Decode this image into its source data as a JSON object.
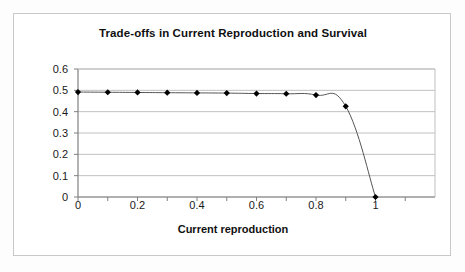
{
  "chart_data": {
    "type": "line",
    "title": "Trade-offs in Current Reproduction and Survival",
    "xlabel": "Current reproduction",
    "ylabel": "Adjusted survival",
    "xlim": [
      0,
      1.2
    ],
    "ylim": [
      0,
      0.6
    ],
    "grid": "horizontal",
    "legend": "none",
    "marker": "diamond",
    "x": [
      0,
      0.1,
      0.2,
      0.3,
      0.4,
      0.5,
      0.6,
      0.7,
      0.8,
      0.9,
      1
    ],
    "values": [
      0.492,
      0.491,
      0.49,
      0.489,
      0.488,
      0.487,
      0.485,
      0.484,
      0.478,
      0.425,
      0
    ],
    "xticks": [
      0,
      0.2,
      0.4,
      0.6,
      0.8,
      1
    ],
    "xtick_labels": [
      "0",
      "0.2",
      "0.4",
      "0.6",
      "0.8",
      "1"
    ],
    "xticks_minor": [
      0.1,
      0.3,
      0.5,
      0.7,
      0.9,
      1.1
    ],
    "yticks": [
      0,
      0.1,
      0.2,
      0.3,
      0.4,
      0.5,
      0.6
    ],
    "ytick_labels": [
      "0",
      "0.1",
      "0.2",
      "0.3",
      "0.4",
      "0.5",
      "0.6"
    ],
    "series": [
      {
        "name": "Adjusted survival",
        "values": [
          0.492,
          0.491,
          0.49,
          0.489,
          0.488,
          0.487,
          0.485,
          0.484,
          0.478,
          0.425,
          0
        ]
      }
    ],
    "colors": {
      "line": "#555555",
      "marker": "#000000",
      "grid": "#c0c0c0",
      "axis": "#808080",
      "text": "#101010",
      "plot_background": "#ffffff",
      "chart_background": "#ffffff",
      "chart_border": "#c8c8c8"
    }
  }
}
